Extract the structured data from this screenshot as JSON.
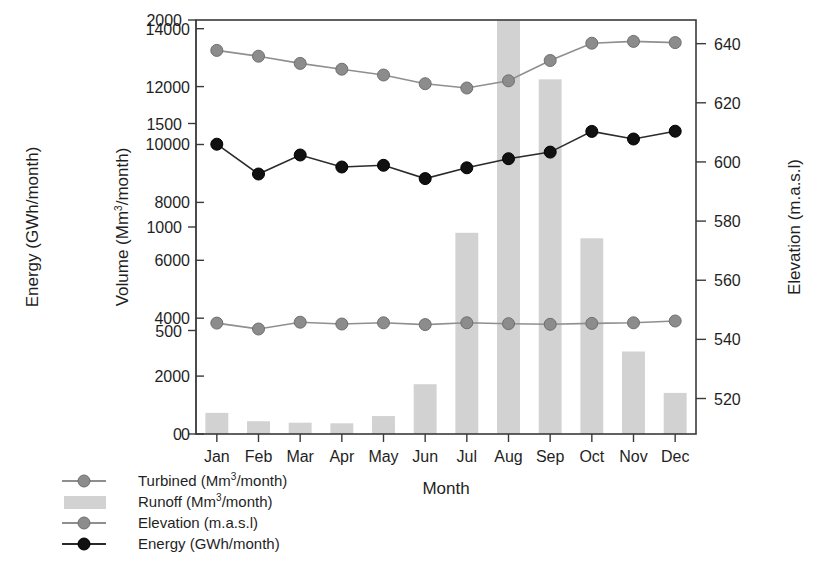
{
  "chart_data": {
    "type": "bar",
    "title": "",
    "xlabel": "Month",
    "categories": [
      "Jan",
      "Feb",
      "Mar",
      "Apr",
      "May",
      "Jun",
      "Jul",
      "Aug",
      "Sep",
      "Oct",
      "Nov",
      "Dec"
    ],
    "axes": {
      "left_outer": {
        "label": "Energy (GWh/month)",
        "ticks": [
          0,
          500,
          1000,
          1500,
          2000
        ],
        "range": [
          0,
          2000
        ]
      },
      "left_inner": {
        "label": "Volume (Mm3/month)",
        "label_base": "Volume (Mm",
        "label_sup": "3",
        "label_tail": "/month)",
        "ticks": [
          0,
          2000,
          4000,
          6000,
          8000,
          10000,
          12000,
          14000
        ],
        "range": [
          0,
          14300
        ]
      },
      "right": {
        "label": "Elevation (m.a.s.l)",
        "ticks": [
          520,
          540,
          560,
          580,
          600,
          620,
          640
        ],
        "range": [
          508,
          648
        ]
      }
    },
    "grid": false,
    "legend_position": "below-left",
    "series": [
      {
        "name": "Turbined (Mm3/month)",
        "label_base": "Turbined  (Mm",
        "label_sup": "3",
        "label_tail": "/month)",
        "type": "line",
        "axis": "left_inner",
        "marker": "circle",
        "color": "#8c8c8c",
        "values": [
          13250,
          13050,
          12800,
          12600,
          12400,
          12100,
          11950,
          12200,
          12900,
          13500,
          13560,
          13520
        ]
      },
      {
        "name": "Runoff (Mm3/month)",
        "label_base": "Runoff  (Mm",
        "label_sup": "3",
        "label_tail": "/month)",
        "type": "bar",
        "axis": "left_inner",
        "color": "#d2d2d2",
        "values": [
          730,
          440,
          390,
          370,
          620,
          1720,
          6950,
          14300,
          12250,
          6760,
          2850,
          1420
        ]
      },
      {
        "name": "Elevation (m.a.s.l)",
        "label_base": "Elevation (m.a.s.l)",
        "label_sup": "",
        "label_tail": "",
        "type": "line",
        "axis": "right",
        "marker": "circle",
        "color": "#8c8c8c",
        "values": [
          545.5,
          543.5,
          545.8,
          545.2,
          545.6,
          545.0,
          545.6,
          545.3,
          545.1,
          545.4,
          545.6,
          546.2
        ]
      },
      {
        "name": "Energy (GWh/month)",
        "label_base": "Energy (GWh/month)",
        "label_sup": "",
        "label_tail": "",
        "type": "line",
        "axis": "left_outer",
        "marker": "circle",
        "color": "#111111",
        "values": [
          1400,
          1256,
          1348,
          1290,
          1298,
          1234,
          1286,
          1330,
          1362,
          1462,
          1425,
          1463
        ]
      }
    ]
  },
  "legend": [
    {
      "key": "turbined",
      "marker": "line-circle-gray"
    },
    {
      "key": "runoff",
      "marker": "swatch-gray"
    },
    {
      "key": "elevation",
      "marker": "line-circle-gray"
    },
    {
      "key": "energy",
      "marker": "line-circle-black"
    }
  ],
  "caption": ""
}
